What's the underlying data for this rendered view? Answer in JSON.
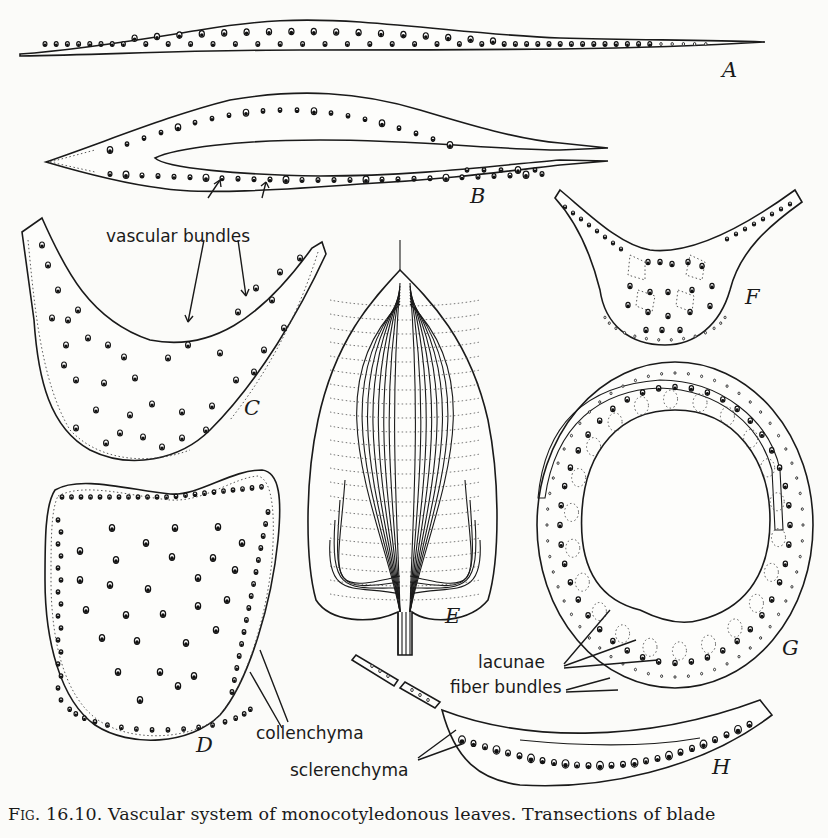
{
  "figure": {
    "number_label": "Fig. 16.10.",
    "caption": "Vascular system of monocotyledonous leaves.  Transections of blade",
    "colors": {
      "ink": "#1a1a1a",
      "paper": "#fbfbf9"
    }
  },
  "panels": [
    {
      "id": "A",
      "label": "A",
      "description": "flat linear leaf blade transection with a single row of vascular bundles"
    },
    {
      "id": "B",
      "label": "B",
      "description": "folded (conduplicate) leaf blade transection"
    },
    {
      "id": "C",
      "label": "C",
      "description": "V-shaped / keeled blade transection"
    },
    {
      "id": "D",
      "label": "D",
      "description": "thick, nearly triangular blade transection"
    },
    {
      "id": "E",
      "label": "E",
      "description": "whole leaf with parallel-curved venation"
    },
    {
      "id": "F",
      "label": "F",
      "description": "keeled blade transection with lacunae"
    },
    {
      "id": "G",
      "label": "G",
      "description": "sheathing, nearly circular leaf transection"
    },
    {
      "id": "H",
      "label": "H",
      "description": "thin blade transection with sclerenchyma girders"
    }
  ],
  "annotations": {
    "vascular_bundles": "vascular bundles",
    "collenchyma": "collenchyma",
    "lacunae": "lacunae",
    "fiber_bundles": "fiber bundles",
    "sclerenchyma": "sclerenchyma"
  }
}
